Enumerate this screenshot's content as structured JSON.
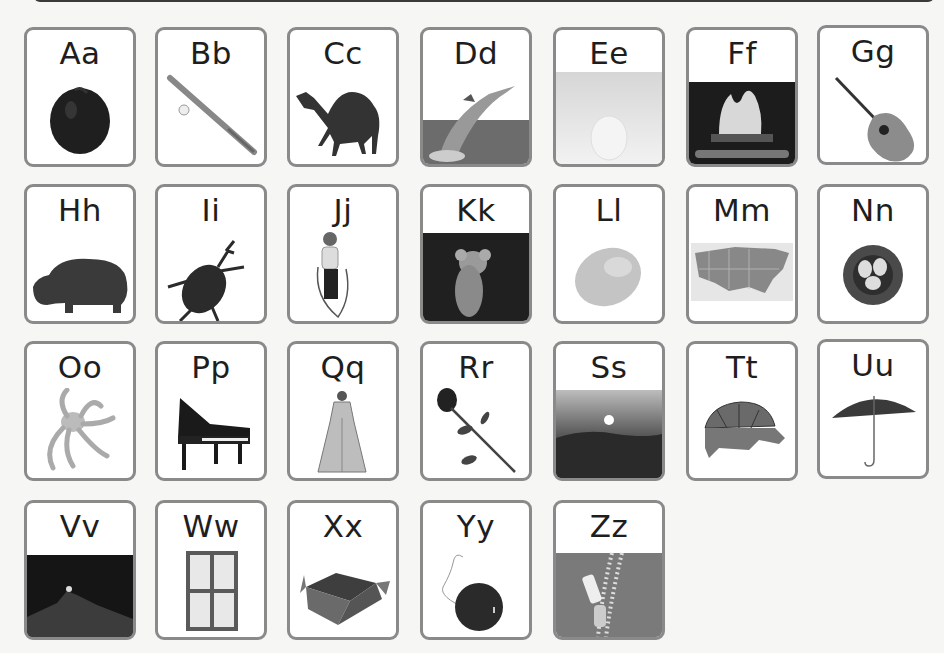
{
  "cards": [
    {
      "letter": "Aa",
      "picture": "apple",
      "icon": "apple-icon"
    },
    {
      "letter": "Bb",
      "picture": "baseball bat",
      "icon": "baseball-bat-icon"
    },
    {
      "letter": "Cc",
      "picture": "camel",
      "icon": "camel-icon"
    },
    {
      "letter": "Dd",
      "picture": "dolphin",
      "icon": "dolphin-icon"
    },
    {
      "letter": "Ee",
      "picture": "egg",
      "icon": "egg-icon"
    },
    {
      "letter": "Ff",
      "picture": "fireplace",
      "icon": "fireplace-icon"
    },
    {
      "letter": "Gg",
      "picture": "guitar",
      "icon": "guitar-icon"
    },
    {
      "letter": "Hh",
      "picture": "hippopotamus",
      "icon": "hippo-icon"
    },
    {
      "letter": "Ii",
      "picture": "insect",
      "icon": "beetle-icon"
    },
    {
      "letter": "Jj",
      "picture": "jump rope",
      "icon": "jump-rope-girl-icon"
    },
    {
      "letter": "Kk",
      "picture": "koala",
      "icon": "koala-icon"
    },
    {
      "letter": "Ll",
      "picture": "lemon",
      "icon": "lemon-icon"
    },
    {
      "letter": "Mm",
      "picture": "map",
      "icon": "us-map-icon"
    },
    {
      "letter": "Nn",
      "picture": "nest",
      "icon": "nest-icon"
    },
    {
      "letter": "Oo",
      "picture": "octopus",
      "icon": "octopus-icon"
    },
    {
      "letter": "Pp",
      "picture": "piano",
      "icon": "piano-icon"
    },
    {
      "letter": "Qq",
      "picture": "queen",
      "icon": "queen-icon"
    },
    {
      "letter": "Rr",
      "picture": "rose",
      "icon": "rose-icon"
    },
    {
      "letter": "Ss",
      "picture": "sunset",
      "icon": "sunset-icon"
    },
    {
      "letter": "Tt",
      "picture": "turtle",
      "icon": "turtle-icon"
    },
    {
      "letter": "Uu",
      "picture": "umbrella",
      "icon": "umbrella-icon"
    },
    {
      "letter": "Vv",
      "picture": "volcano",
      "icon": "volcano-icon"
    },
    {
      "letter": "Ww",
      "picture": "window",
      "icon": "window-icon"
    },
    {
      "letter": "Xx",
      "picture": "box",
      "icon": "box-icon"
    },
    {
      "letter": "Yy",
      "picture": "yo-yo",
      "icon": "yoyo-icon"
    },
    {
      "letter": "Zz",
      "picture": "zipper",
      "icon": "zipper-icon"
    }
  ],
  "colors": {
    "card_border": "#8a8a8a",
    "card_bg": "#ffffff",
    "label": "#1e1e1e",
    "page_bg": "#f6f6f5"
  }
}
